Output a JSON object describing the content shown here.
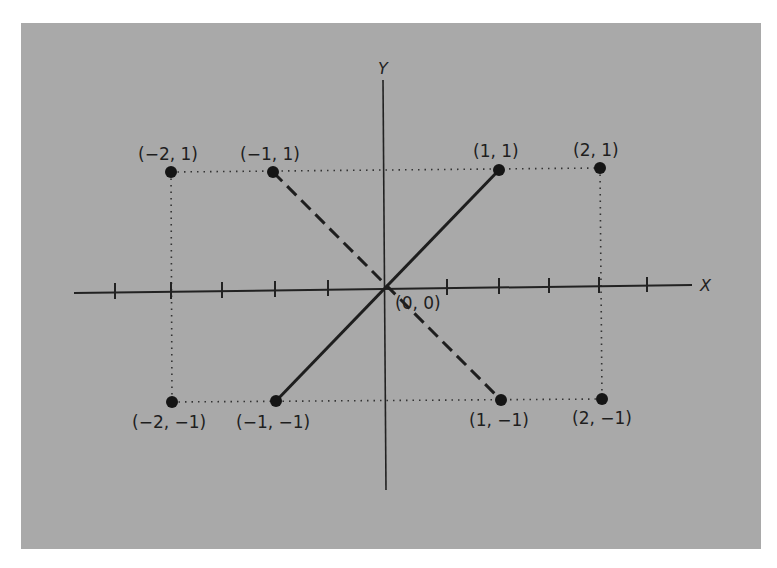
{
  "diagram": {
    "background_color": "#a9a9a9",
    "axes": {
      "x_label": "X",
      "y_label": "Y",
      "origin_label": "(0, 0)",
      "x_ticks": [
        -2.5,
        -2,
        -1.5,
        -1,
        -0.5,
        0.5,
        1,
        1.5,
        2,
        2.5
      ]
    },
    "points": [
      {
        "label": "(−2, 1)",
        "x": -2,
        "y": 1
      },
      {
        "label": "(−1, 1)",
        "x": -1,
        "y": 1
      },
      {
        "label": "(1, 1)",
        "x": 1,
        "y": 1
      },
      {
        "label": "(2, 1)",
        "x": 2,
        "y": 1
      },
      {
        "label": "(−2, −1)",
        "x": -2,
        "y": -1
      },
      {
        "label": "(−1, −1)",
        "x": -1,
        "y": -1
      },
      {
        "label": "(1, −1)",
        "x": 1,
        "y": -1
      },
      {
        "label": "(2, −1)",
        "x": 2,
        "y": -1
      }
    ],
    "segments": [
      {
        "from": "(-1, -1)",
        "to": "(1, 1)",
        "style": "solid"
      },
      {
        "from": "(-1, 1)",
        "to": "(1, -1)",
        "style": "dashed"
      }
    ],
    "guides": "dotted rectangle connecting (-2,1), (2,1), (2,-1), (-2,-1)"
  }
}
